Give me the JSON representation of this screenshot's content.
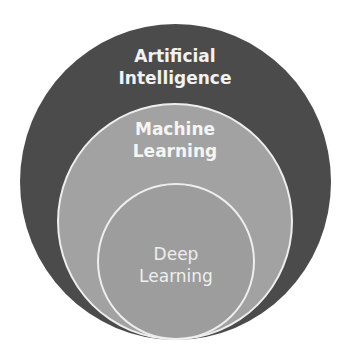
{
  "diagram": {
    "type": "nested-circles",
    "title": "",
    "colors": {
      "outer": "#4b4b4b",
      "middle": "#a2a2a2",
      "inner": "#9d9d9d",
      "border": "#eeeeee"
    },
    "circles": [
      {
        "id": "outer",
        "line1": "Artificial",
        "line2": "Intelligence"
      },
      {
        "id": "middle",
        "line1": "Machine",
        "line2": "Learning"
      },
      {
        "id": "inner",
        "line1": "Deep",
        "line2": "Learning"
      }
    ]
  }
}
